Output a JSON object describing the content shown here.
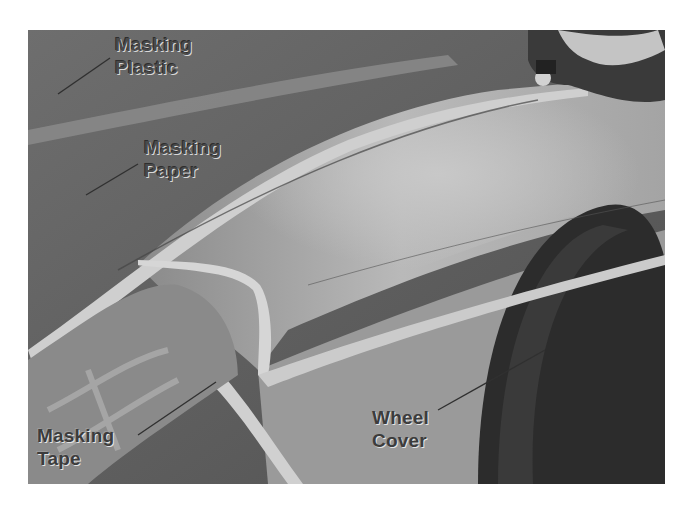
{
  "figure": {
    "labels": {
      "masking_plastic": {
        "line1": "Masking",
        "line2": "Plastic"
      },
      "masking_paper": {
        "line1": "Masking",
        "line2": "Paper"
      },
      "masking_tape": {
        "line1": "Masking",
        "line2": "Tape"
      },
      "wheel_cover": {
        "line1": "Wheel",
        "line2": "Cover"
      }
    }
  }
}
